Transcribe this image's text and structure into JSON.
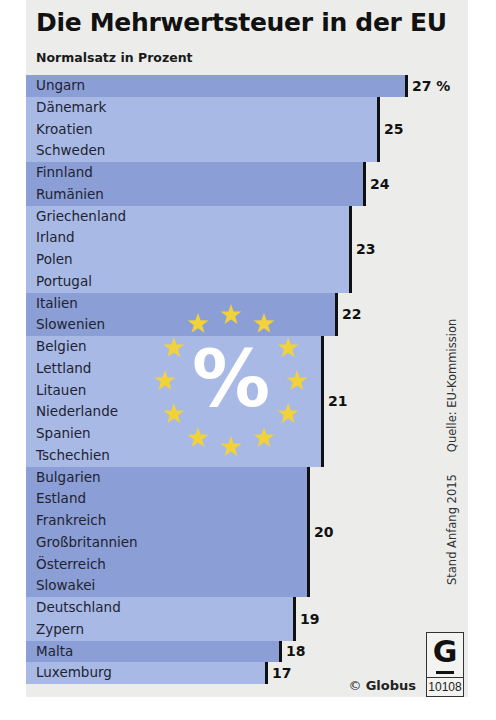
{
  "header": {
    "title": "Die Mehrwertsteuer in der EU",
    "subtitle": "Normalsatz in Prozent"
  },
  "colors": {
    "bar_dark": "#8b9ed6",
    "bar_light": "#a8b9e6",
    "panel_bg": "#ecedea",
    "star": "#f2d23a"
  },
  "groups": [
    {
      "value": 27,
      "label": "27 %",
      "shade": "dark",
      "countries": [
        "Ungarn"
      ]
    },
    {
      "value": 25,
      "label": "25",
      "shade": "light",
      "countries": [
        "Dänemark",
        "Kroatien",
        "Schweden"
      ]
    },
    {
      "value": 24,
      "label": "24",
      "shade": "dark",
      "countries": [
        "Finnland",
        "Rumänien"
      ]
    },
    {
      "value": 23,
      "label": "23",
      "shade": "light",
      "countries": [
        "Griechenland",
        "Irland",
        "Polen",
        "Portugal"
      ]
    },
    {
      "value": 22,
      "label": "22",
      "shade": "dark",
      "countries": [
        "Italien",
        "Slowenien"
      ]
    },
    {
      "value": 21,
      "label": "21",
      "shade": "light",
      "countries": [
        "Belgien",
        "Lettland",
        "Litauen",
        "Niederlande",
        "Spanien",
        "Tschechien"
      ]
    },
    {
      "value": 20,
      "label": "20",
      "shade": "dark",
      "countries": [
        "Bulgarien",
        "Estland",
        "Frankreich",
        "Großbritannien",
        "Österreich",
        "Slowakei"
      ]
    },
    {
      "value": 19,
      "label": "19",
      "shade": "light",
      "countries": [
        "Deutschland",
        "Zypern"
      ]
    },
    {
      "value": 18,
      "label": "18",
      "shade": "dark",
      "countries": [
        "Malta"
      ]
    },
    {
      "value": 17,
      "label": "17",
      "shade": "light",
      "countries": [
        "Luxemburg"
      ]
    }
  ],
  "emblem": {
    "symbol": "%",
    "icon": "eu-stars-icon"
  },
  "footer": {
    "source": "Quelle: EU-Kommission",
    "date": "Stand Anfang 2015",
    "copyright_symbol": "©",
    "publisher": "Globus",
    "logo_letter": "G",
    "graphic_number": "10108"
  },
  "chart_data": {
    "type": "bar",
    "orientation": "horizontal",
    "title": "Die Mehrwertsteuer in der EU",
    "subtitle": "Normalsatz in Prozent",
    "xlabel": "",
    "ylabel": "",
    "unit": "%",
    "categories": [
      "Ungarn",
      "Dänemark",
      "Kroatien",
      "Schweden",
      "Finnland",
      "Rumänien",
      "Griechenland",
      "Irland",
      "Polen",
      "Portugal",
      "Italien",
      "Slowenien",
      "Belgien",
      "Lettland",
      "Litauen",
      "Niederlande",
      "Spanien",
      "Tschechien",
      "Bulgarien",
      "Estland",
      "Frankreich",
      "Großbritannien",
      "Österreich",
      "Slowakei",
      "Deutschland",
      "Zypern",
      "Malta",
      "Luxemburg"
    ],
    "values": [
      27,
      25,
      25,
      25,
      24,
      24,
      23,
      23,
      23,
      23,
      22,
      22,
      21,
      21,
      21,
      21,
      21,
      21,
      20,
      20,
      20,
      20,
      20,
      20,
      19,
      19,
      18,
      17
    ],
    "grid": false,
    "legend": null,
    "annotations": [
      "Quelle: EU-Kommission",
      "Stand Anfang 2015",
      "© Globus 10108"
    ]
  }
}
